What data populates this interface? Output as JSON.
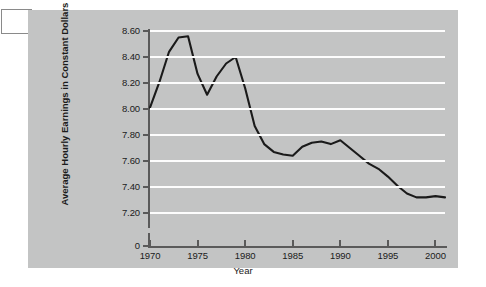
{
  "corner_box": {
    "label": ""
  },
  "chart_data": {
    "type": "line",
    "title": "",
    "xlabel": "Year",
    "ylabel": "Average Hourly Earnings in Constant Dollars",
    "xlim": [
      1970,
      2001
    ],
    "ylim": [
      7.1,
      8.6
    ],
    "grid": true,
    "legend": "none",
    "axis_break_label": "0",
    "ytick_labels": [
      "8.60",
      "8.40",
      "8.20",
      "8.00",
      "7.80",
      "7.60",
      "7.40",
      "7.20"
    ],
    "ytick_values": [
      8.6,
      8.4,
      8.2,
      8.0,
      7.8,
      7.6,
      7.4,
      7.2
    ],
    "xtick_labels": [
      "1970",
      "1975",
      "1980",
      "1985",
      "1990",
      "1995",
      "2000"
    ],
    "xtick_values": [
      1970,
      1975,
      1980,
      1985,
      1990,
      1995,
      2000
    ],
    "x": [
      1970,
      1971,
      1972,
      1973,
      1974,
      1975,
      1976,
      1977,
      1978,
      1979,
      1980,
      1981,
      1982,
      1983,
      1984,
      1985,
      1986,
      1987,
      1988,
      1989,
      1990,
      1991,
      1992,
      1993,
      1994,
      1995,
      1996,
      1997,
      1998,
      1999,
      2000,
      2001
    ],
    "values": [
      8.01,
      8.21,
      8.44,
      8.55,
      8.56,
      8.27,
      8.11,
      8.25,
      8.35,
      8.4,
      8.16,
      7.87,
      7.73,
      7.67,
      7.65,
      7.64,
      7.71,
      7.74,
      7.75,
      7.73,
      7.76,
      7.7,
      7.64,
      7.58,
      7.54,
      7.48,
      7.41,
      7.35,
      7.32,
      7.32,
      7.33,
      7.32
    ],
    "series_color": "#1a1a1a",
    "gridline_color": "#fdfdfd",
    "panel_color": "#c3c4c4",
    "axis_color": "#5a5a5a"
  }
}
